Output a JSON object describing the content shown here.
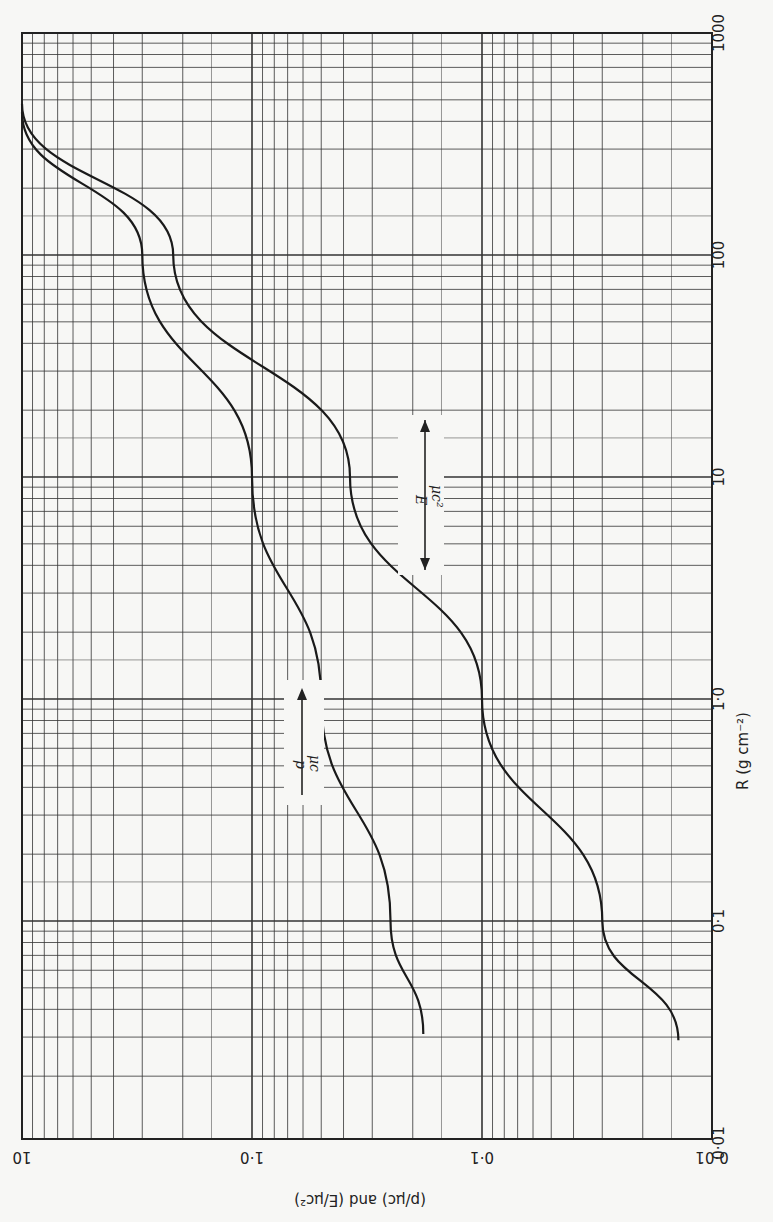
{
  "chart_data": {
    "type": "line",
    "title": "",
    "orientation_note": "page rotated 90°: R axis runs vertically (right side labels), value axis runs horizontally (bottom labels)",
    "xlabel": "R (g cm^-2)",
    "ylabel": "(p/μc) and (E/μc²)",
    "x_scale": "log",
    "y_scale": "log",
    "xlim": [
      0.01,
      1000
    ],
    "ylim": [
      0.01,
      10
    ],
    "grid": true,
    "x_ticks": [
      "0·01",
      "0·1",
      "1·0",
      "10",
      "100",
      "1000"
    ],
    "y_ticks": [
      "10",
      "1·0",
      "0·1",
      "0·01"
    ],
    "series": [
      {
        "name": "p/μc",
        "x": [
          0.031,
          0.1,
          1.0,
          10,
          100,
          440
        ],
        "values": [
          0.18,
          0.25,
          0.5,
          1.0,
          3.0,
          10
        ]
      },
      {
        "name": "E/μc²",
        "x": [
          0.029,
          0.1,
          1.0,
          10,
          100,
          480
        ],
        "values": [
          0.014,
          0.03,
          0.1,
          0.375,
          2.2,
          10
        ]
      }
    ],
    "annotations": [
      "p / μc (arrow)",
      "E / μc² (double arrow)"
    ]
  },
  "labels": {
    "r_ticks": [
      {
        "text": "1000",
        "r": 1000
      },
      {
        "text": "100",
        "r": 100
      },
      {
        "text": "10",
        "r": 10
      },
      {
        "text": "1·0",
        "r": 1
      },
      {
        "text": "0·1",
        "r": 0.1
      },
      {
        "text": "0·01",
        "r": 0.01
      }
    ],
    "v_ticks": [
      {
        "text": "10",
        "v": 10
      },
      {
        "text": "1·0",
        "v": 1
      },
      {
        "text": "0·1",
        "v": 0.1
      },
      {
        "text": "0·01",
        "v": 0.01
      }
    ],
    "r_axis_title": "R  (g cm⁻²)",
    "v_axis_title": "(p/μc)  and  (E/μc²)",
    "p_label_num": "p",
    "p_label_den": "μc",
    "e_label_num": "E",
    "e_label_den": "μc²"
  },
  "colors": {
    "ink": "#222222",
    "paper": "#f7f7f5",
    "grid": "#444444"
  }
}
